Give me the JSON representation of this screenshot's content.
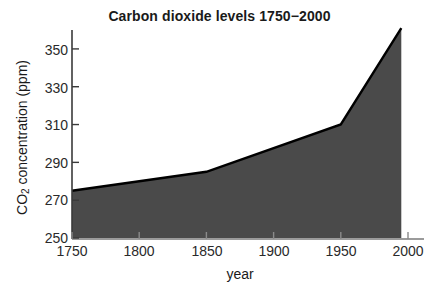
{
  "chart_data": {
    "type": "area",
    "title": "Carbon dioxide levels 1750−2000",
    "xlabel": "year",
    "ylabel": "CO2 concentration (ppm)",
    "ylabel_parts": {
      "pre": "CO",
      "sub": "2",
      "post": " concentration (ppm)"
    },
    "x": [
      1750,
      1850,
      1950,
      1995
    ],
    "values": [
      275,
      285,
      310,
      361
    ],
    "series": [
      {
        "name": "CO2 concentration",
        "values": [
          275,
          285,
          310,
          361
        ]
      }
    ],
    "xlim": [
      1750,
      2000
    ],
    "ylim": [
      250,
      360
    ],
    "xticks": [
      "1750",
      "1800",
      "1850",
      "1900",
      "1950",
      "2000"
    ],
    "xtick_values": [
      1750,
      1800,
      1850,
      1900,
      1950,
      2000
    ],
    "yticks": [
      "250",
      "270",
      "290",
      "310",
      "330",
      "350"
    ],
    "ytick_values": [
      250,
      270,
      290,
      310,
      330,
      350
    ],
    "grid": false,
    "legend": false,
    "fill_color": "#4a4a4a",
    "line_color": "#000000",
    "axis_color": "#3a3a3a",
    "background_color": "#ffffff",
    "text_color": "#1a1a1a"
  }
}
